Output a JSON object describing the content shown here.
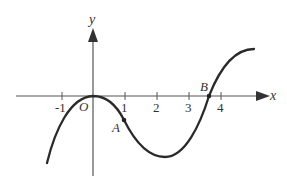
{
  "figure": {
    "type": "function-graph",
    "axes": {
      "x_label": "x",
      "y_label": "y",
      "origin_label": "O",
      "x_ticks": [
        "-1",
        "1",
        "2",
        "3",
        "4"
      ]
    },
    "points": [
      {
        "name": "A",
        "label": "A",
        "x": 1
      },
      {
        "name": "B",
        "label": "B",
        "x": 3.6
      }
    ],
    "curve": {
      "description": "cubic-like curve: rises from lower-left, local maximum at origin O, passes through A near x=1, local minimum near x=2.3, crosses x-axis at B between 3 and 4, rises and levels off to upper-right"
    },
    "colors": {
      "curve": "#2a2a2a",
      "axis": "#555555",
      "text": "#333333"
    }
  }
}
